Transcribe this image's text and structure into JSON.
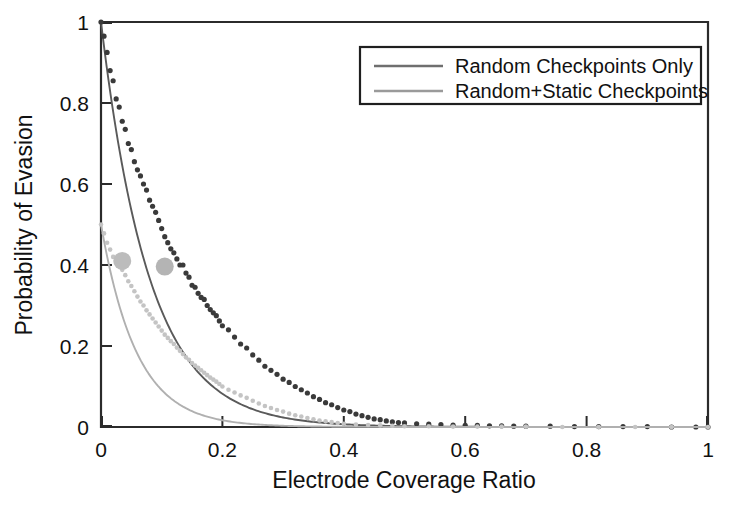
{
  "chart_data": {
    "type": "scatter",
    "title": "",
    "xlabel": "Electrode Coverage Ratio",
    "ylabel": "Probability of Evasion",
    "xlim": [
      0,
      1
    ],
    "ylim": [
      0,
      1
    ],
    "xticks": [
      0,
      0.2,
      0.4,
      0.6,
      0.8,
      1
    ],
    "xticklabels": [
      "0",
      "0.2",
      "0.4",
      "0.6",
      "0.8",
      "1"
    ],
    "yticks": [
      0,
      0.2,
      0.4,
      0.6,
      0.8,
      1
    ],
    "yticklabels": [
      "0",
      "0.2",
      "0.4",
      "0.6",
      "0.8",
      "1"
    ],
    "grid": false,
    "legend_position": "upper right",
    "series": [
      {
        "name": "Random Checkpoints Only",
        "color": "#3a3a3a",
        "marker": "dot",
        "fit_model": "exponential_decay",
        "fit_amplitude": 1.0,
        "fit_rate": 12.5,
        "x": [
          0.0,
          0.005,
          0.01,
          0.015,
          0.02,
          0.025,
          0.03,
          0.035,
          0.04,
          0.045,
          0.05,
          0.055,
          0.06,
          0.065,
          0.07,
          0.075,
          0.08,
          0.085,
          0.09,
          0.095,
          0.1,
          0.105,
          0.11,
          0.115,
          0.12,
          0.125,
          0.13,
          0.135,
          0.14,
          0.145,
          0.15,
          0.155,
          0.16,
          0.165,
          0.17,
          0.175,
          0.18,
          0.185,
          0.19,
          0.195,
          0.2,
          0.21,
          0.22,
          0.23,
          0.24,
          0.25,
          0.26,
          0.27,
          0.28,
          0.29,
          0.3,
          0.31,
          0.32,
          0.33,
          0.34,
          0.35,
          0.36,
          0.37,
          0.38,
          0.39,
          0.4,
          0.41,
          0.42,
          0.43,
          0.44,
          0.45,
          0.46,
          0.47,
          0.48,
          0.49,
          0.5,
          0.52,
          0.54,
          0.56,
          0.58,
          0.6,
          0.62,
          0.64,
          0.66,
          0.68,
          0.7,
          0.74,
          0.78,
          0.82,
          0.86,
          0.9,
          0.94,
          0.98,
          1.0
        ],
        "y": [
          1.0,
          0.965,
          0.925,
          0.88,
          0.855,
          0.81,
          0.79,
          0.755,
          0.735,
          0.7,
          0.685,
          0.655,
          0.635,
          0.62,
          0.6,
          0.585,
          0.56,
          0.545,
          0.53,
          0.51,
          0.49,
          0.47,
          0.455,
          0.44,
          0.43,
          0.415,
          0.4,
          0.4,
          0.38,
          0.37,
          0.35,
          0.345,
          0.33,
          0.32,
          0.315,
          0.3,
          0.29,
          0.282,
          0.275,
          0.262,
          0.25,
          0.24,
          0.222,
          0.205,
          0.195,
          0.178,
          0.165,
          0.15,
          0.14,
          0.13,
          0.118,
          0.11,
          0.1,
          0.092,
          0.084,
          0.075,
          0.068,
          0.06,
          0.055,
          0.048,
          0.042,
          0.038,
          0.032,
          0.028,
          0.024,
          0.02,
          0.018,
          0.015,
          0.013,
          0.011,
          0.01,
          0.008,
          0.007,
          0.006,
          0.005,
          0.004,
          0.004,
          0.003,
          0.003,
          0.002,
          0.002,
          0.002,
          0.001,
          0.001,
          0.001,
          0.001,
          0.0,
          0.0,
          0.0
        ]
      },
      {
        "name": "Random+Static Checkpoints",
        "color": "#c4c4c4",
        "marker": "dot",
        "fit_model": "exponential_decay",
        "fit_amplitude": 0.5,
        "fit_rate": 17.0,
        "x": [
          0.0,
          0.005,
          0.01,
          0.015,
          0.02,
          0.025,
          0.03,
          0.035,
          0.04,
          0.045,
          0.05,
          0.055,
          0.06,
          0.065,
          0.07,
          0.075,
          0.08,
          0.085,
          0.09,
          0.095,
          0.1,
          0.105,
          0.11,
          0.115,
          0.12,
          0.125,
          0.13,
          0.135,
          0.14,
          0.145,
          0.15,
          0.155,
          0.16,
          0.165,
          0.17,
          0.175,
          0.18,
          0.185,
          0.19,
          0.195,
          0.2,
          0.21,
          0.22,
          0.23,
          0.24,
          0.25,
          0.26,
          0.27,
          0.28,
          0.29,
          0.3,
          0.31,
          0.32,
          0.33,
          0.34,
          0.35,
          0.36,
          0.37,
          0.38,
          0.39,
          0.4,
          0.42,
          0.44,
          0.46,
          0.48,
          0.5,
          0.54,
          0.58,
          0.62,
          0.66,
          0.7,
          0.76,
          0.82,
          0.88,
          0.94,
          1.0
        ],
        "y": [
          0.5,
          0.478,
          0.455,
          0.438,
          0.42,
          0.412,
          0.4,
          0.388,
          0.375,
          0.36,
          0.348,
          0.335,
          0.322,
          0.31,
          0.3,
          0.288,
          0.278,
          0.268,
          0.258,
          0.248,
          0.238,
          0.228,
          0.22,
          0.212,
          0.205,
          0.196,
          0.188,
          0.18,
          0.172,
          0.166,
          0.158,
          0.152,
          0.146,
          0.14,
          0.134,
          0.128,
          0.122,
          0.117,
          0.112,
          0.106,
          0.1,
          0.092,
          0.085,
          0.078,
          0.072,
          0.065,
          0.058,
          0.052,
          0.047,
          0.042,
          0.038,
          0.033,
          0.029,
          0.026,
          0.022,
          0.019,
          0.016,
          0.014,
          0.012,
          0.01,
          0.008,
          0.006,
          0.005,
          0.004,
          0.003,
          0.002,
          0.002,
          0.001,
          0.001,
          0.001,
          0.001,
          0.0,
          0.0,
          0.0,
          0.0,
          0.0
        ]
      }
    ],
    "highlight_markers": [
      {
        "x": 0.035,
        "y": 0.41,
        "color": "#bcbcbc",
        "radius": 9
      },
      {
        "x": 0.105,
        "y": 0.396,
        "color": "#b4b4b4",
        "radius": 9
      }
    ]
  },
  "legend": {
    "entries": [
      {
        "label": "Random Checkpoints Only",
        "color": "#6f6f6f"
      },
      {
        "label": "Random+Static Checkpoints",
        "color": "#9a9a9a"
      }
    ]
  },
  "colors": {
    "axis": "#2b2b2b",
    "text": "#111111",
    "background": "#ffffff",
    "series_dark": "#3a3a3a",
    "series_light": "#c4c4c4"
  }
}
